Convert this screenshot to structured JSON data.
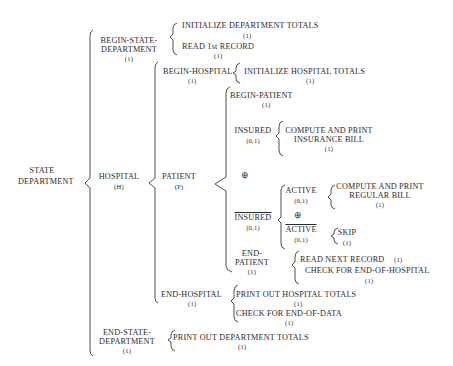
{
  "diagram": {
    "type": "warnier-orr",
    "root": {
      "label_line1": "STATE",
      "label_line2": "DEPARTMENT"
    },
    "begin_state": {
      "line1": "BEGIN-STATE-",
      "line2": "DEPARTMENT",
      "count": "(1)",
      "actions": [
        {
          "label": "INITIALIZE DEPARTMENT TOTALS",
          "count": "(1)"
        },
        {
          "label": "READ 1st RECORD",
          "count": "(1)"
        }
      ]
    },
    "hospital": {
      "label": "HOSPITAL",
      "count": "(H)"
    },
    "begin_hospital": {
      "label": "BEGIN-HOSPITAL",
      "count": "(1)",
      "action": {
        "label": "INITIALIZE HOSPITAL TOTALS",
        "count": "(1)"
      }
    },
    "patient": {
      "label": "PATIENT",
      "count": "(P)"
    },
    "begin_patient": {
      "label": "BEGIN-PATIENT",
      "count": "(1)"
    },
    "insured": {
      "label": "INSURED",
      "count": "(0,1)",
      "action": {
        "line1": "COMPUTE AND PRINT",
        "line2": "INSURANCE BILL",
        "count": "(1)"
      }
    },
    "xor_symbol": "⊕",
    "not_insured": {
      "label": "INSURED",
      "count": "(0,1)",
      "negated": true
    },
    "active": {
      "label": "ACTIVE",
      "count": "(0,1)",
      "action": {
        "line1": "COMPUTE AND PRINT",
        "line2": "REGULAR BILL",
        "count": "(1)"
      }
    },
    "not_active": {
      "label": "ACTIVE",
      "count": "(0,1)",
      "negated": true,
      "action": {
        "label": "SKIP",
        "count": "(1)"
      }
    },
    "end_patient": {
      "line1": "END-",
      "line2": "PATIENT",
      "count": "(1)",
      "actions": [
        {
          "label": "READ NEXT RECORD",
          "count": "(1)"
        },
        {
          "label": "CHECK FOR END-OF-HOSPITAL",
          "count": "(1)"
        }
      ]
    },
    "end_hospital": {
      "label": "END-HOSPITAL",
      "count": "(1)",
      "actions": [
        {
          "label": "PRINT OUT HOSPITAL TOTALS",
          "count": "(1)"
        },
        {
          "label": "CHECK FOR END-OF-DATA",
          "count": "(1)"
        }
      ]
    },
    "end_state": {
      "line1": "END-STATE-",
      "line2": "DEPARTMENT",
      "count": "(1)",
      "action": {
        "label": "PRINT OUT DEPARTMENT TOTALS",
        "count": "(1)"
      }
    }
  }
}
